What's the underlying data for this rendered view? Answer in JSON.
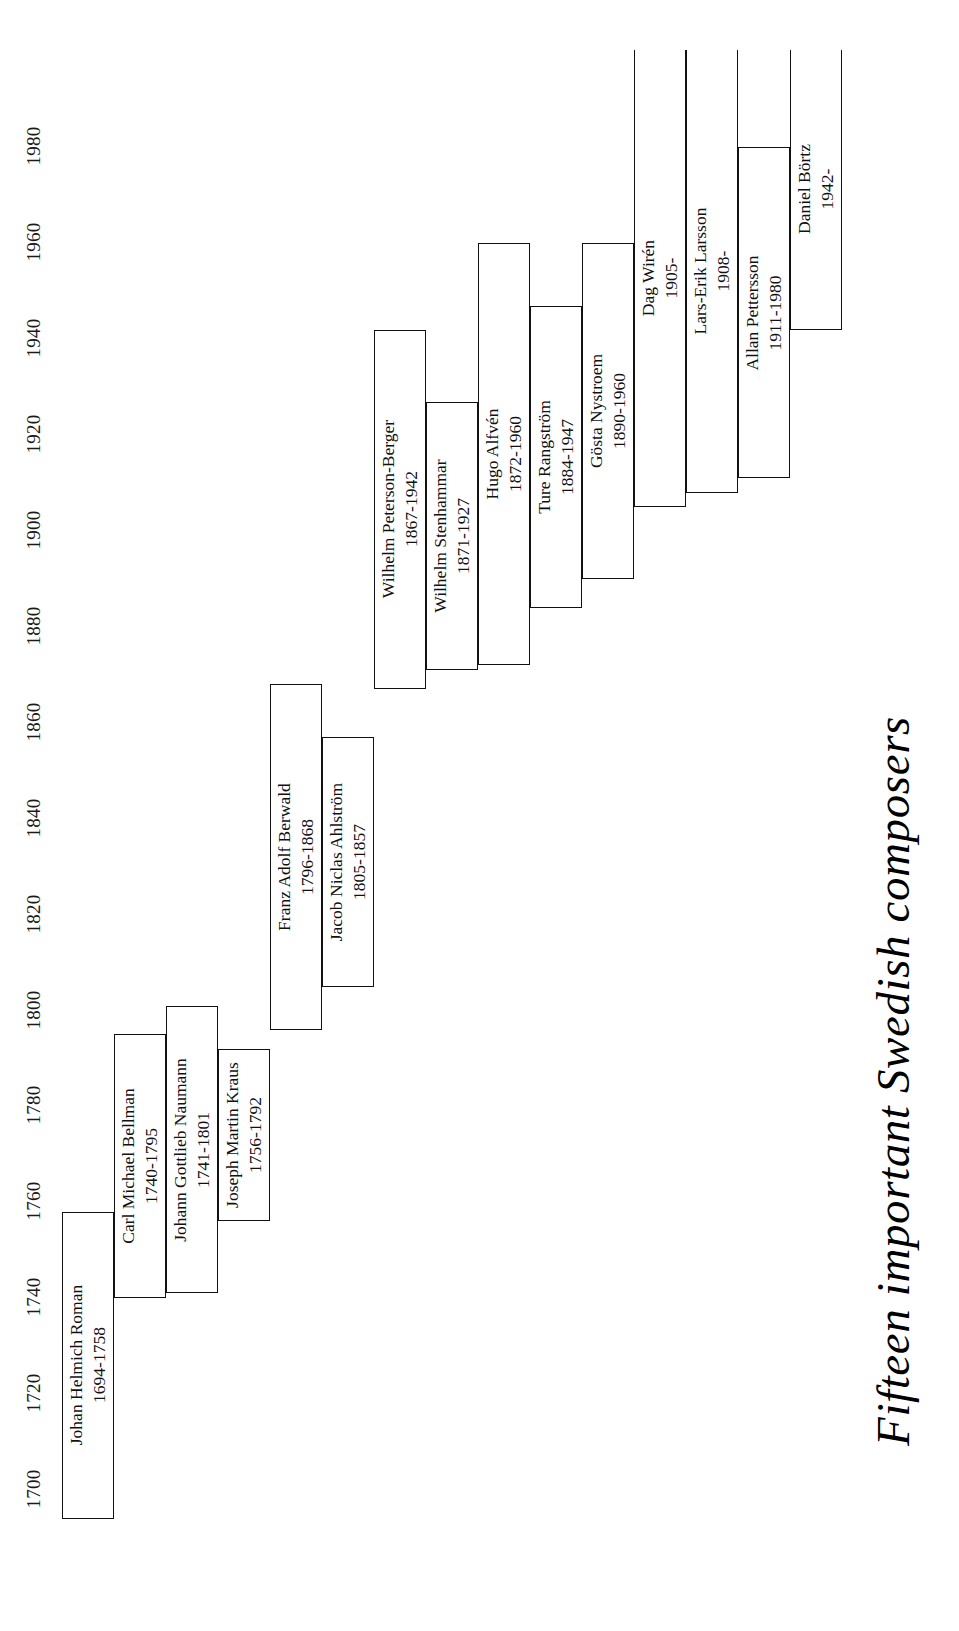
{
  "title": "Fifteen important Swedish composers",
  "chart_data": {
    "type": "bar",
    "orientation": "horizontal-timeline-rotated",
    "title": "Fifteen important Swedish composers",
    "xlabel": "",
    "ylabel": "",
    "grid": false,
    "legend": null,
    "axis": {
      "name": "year",
      "min": 1690,
      "max": 1995,
      "tick_step": 20,
      "ticks": [
        1700,
        1720,
        1740,
        1760,
        1780,
        1800,
        1820,
        1840,
        1860,
        1880,
        1900,
        1920,
        1940,
        1960,
        1980
      ],
      "tick_labels": [
        "1700",
        "1720",
        "1740",
        "1760",
        "1780",
        "1800",
        "1820",
        "1840",
        "1860",
        "1880",
        "1900",
        "1920",
        "1940",
        "1960",
        "1980"
      ]
    },
    "categories": [
      "Johan Helmich Roman",
      "Carl Michael Bellman",
      "Johann Gottlieb Naumann",
      "Joseph Martin Kraus",
      "Franz Adolf Berwald",
      "Jacob Niclas Ahlström",
      "Wilhelm Peterson-Berger",
      "Wilhelm Stenhammar",
      "Hugo Alfvén",
      "Ture Rangström",
      "Gösta Nystroem",
      "Dag Wirén",
      "Lars-Erik Larsson",
      "Allan Pettersson",
      "Daniel Börtz"
    ],
    "composers": [
      {
        "name": "Johan Helmich Roman",
        "years": "1694-1758",
        "birth": 1694,
        "death": 1758,
        "living": false,
        "lane": 0
      },
      {
        "name": "Carl Michael Bellman",
        "years": "1740-1795",
        "birth": 1740,
        "death": 1795,
        "living": false,
        "lane": 1
      },
      {
        "name": "Johann Gottlieb Naumann",
        "years": "1741-1801",
        "birth": 1741,
        "death": 1801,
        "living": false,
        "lane": 2
      },
      {
        "name": "Joseph Martin Kraus",
        "years": "1756-1792",
        "birth": 1756,
        "death": 1792,
        "living": false,
        "lane": 3
      },
      {
        "name": "Franz Adolf Berwald",
        "years": "1796-1868",
        "birth": 1796,
        "death": 1868,
        "living": false,
        "lane": 4
      },
      {
        "name": "Jacob Niclas Ahlström",
        "years": "1805-1857",
        "birth": 1805,
        "death": 1857,
        "living": false,
        "lane": 5
      },
      {
        "name": "Wilhelm Peterson-Berger",
        "years": "1867-1942",
        "birth": 1867,
        "death": 1942,
        "living": false,
        "lane": 6
      },
      {
        "name": "Wilhelm Stenhammar",
        "years": "1871-1927",
        "birth": 1871,
        "death": 1927,
        "living": false,
        "lane": 7
      },
      {
        "name": "Hugo Alfvén",
        "years": "1872-1960",
        "birth": 1872,
        "death": 1960,
        "living": false,
        "lane": 8
      },
      {
        "name": "Ture Rangström",
        "years": "1884-1947",
        "birth": 1884,
        "death": 1947,
        "living": false,
        "lane": 9
      },
      {
        "name": "Gösta Nystroem",
        "years": "1890-1960",
        "birth": 1890,
        "death": 1960,
        "living": false,
        "lane": 10
      },
      {
        "name": "Dag Wirén",
        "years": "1905-",
        "birth": 1905,
        "death": null,
        "living": true,
        "lane": 11
      },
      {
        "name": "Lars-Erik Larsson",
        "years": "1908-",
        "birth": 1908,
        "death": null,
        "living": true,
        "lane": 12
      },
      {
        "name": "Allan Pettersson",
        "years": "1911-1980",
        "birth": 1911,
        "death": 1980,
        "living": false,
        "lane": 13
      },
      {
        "name": "Daniel Börtz",
        "years": "1942-",
        "birth": 1942,
        "death": null,
        "living": true,
        "lane": 14
      }
    ]
  }
}
